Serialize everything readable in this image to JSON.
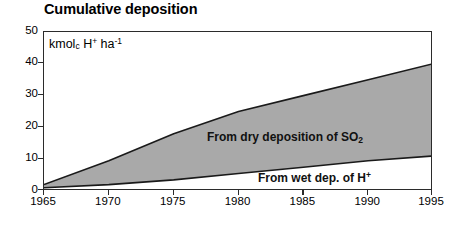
{
  "figure": {
    "title": "Cumulative deposition",
    "unit_label": {
      "prefix": "kmol",
      "sub1": "c",
      "mid": " H",
      "sup1": "+",
      "mid2": " ha",
      "sup2": "-1"
    },
    "accent_fill": "#a9a9a9",
    "line_color": "#1a1a1a",
    "frame_color": "#2b2b2b"
  },
  "chart_data": {
    "type": "area",
    "title": "Cumulative deposition",
    "xlabel": "",
    "ylabel": "kmol_c H+ ha^-1",
    "xlim": [
      1965,
      1995
    ],
    "ylim": [
      0,
      50
    ],
    "grid": false,
    "legend_position": "in-plot annotations",
    "stacked": true,
    "x": [
      1965,
      1970,
      1975,
      1980,
      1985,
      1990,
      1995
    ],
    "xticks": [
      "1965",
      "1970",
      "1975",
      "1980",
      "1985",
      "1990",
      "1995"
    ],
    "yticks": [
      0,
      10,
      20,
      30,
      40,
      50
    ],
    "ytick_labels": [
      "0",
      "10",
      "20",
      "30",
      "40",
      "50"
    ],
    "series": [
      {
        "name": "From wet dep. of H+",
        "label": "From wet dep. of H",
        "label_sup": "+",
        "fill": "#ffffff",
        "values": [
          1.0,
          2.0,
          3.5,
          5.5,
          7.5,
          9.5,
          11.0
        ]
      },
      {
        "name": "From dry deposition of SO2",
        "label": "From dry deposition of SO",
        "label_sub": "2",
        "fill": "#a9a9a9",
        "values": [
          1.0,
          7.5,
          14.5,
          19.5,
          22.5,
          25.5,
          29.0
        ]
      }
    ],
    "cumulative_total": [
      2.0,
      9.5,
      18.0,
      25.0,
      30.0,
      35.0,
      40.0
    ],
    "annotations": [
      {
        "text": "From dry deposition of SO2",
        "x": 1983,
        "y": 17
      },
      {
        "text": "From wet dep. of H+",
        "x": 1987,
        "y": 7
      }
    ]
  }
}
